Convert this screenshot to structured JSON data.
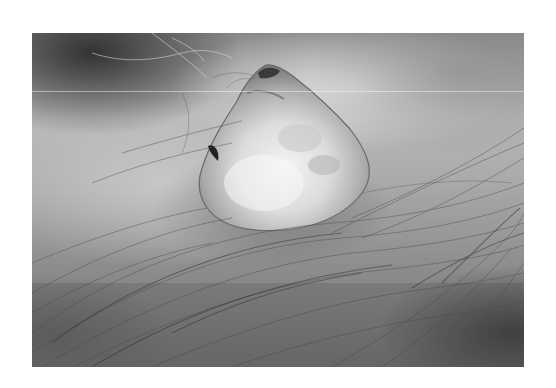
{
  "image": {
    "type": "grayscale clinical photograph",
    "subject": "dome-shaped skin nodule on hairy scalp",
    "background_color": "#ffffff",
    "frame": {
      "left": 32,
      "top": 33,
      "width": 492,
      "height": 334
    },
    "tones": {
      "nodule_highlight": "#ececec",
      "skin_mid": "#a8a8a8",
      "shadow": "#3a3a3a"
    }
  }
}
